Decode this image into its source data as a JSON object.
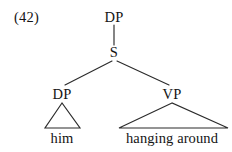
{
  "figure": {
    "example_number": "(42)",
    "type": "syntax-tree",
    "background_color": "#ffffff",
    "line_color": "#2b2b2b",
    "text_color": "#141414"
  },
  "tree": {
    "root": {
      "label": "DP",
      "x": 114,
      "y": 17
    },
    "nodes": [
      {
        "id": "s",
        "label": "S",
        "x": 114,
        "y": 52
      },
      {
        "id": "dp-subject",
        "label": "DP",
        "x": 62,
        "y": 94
      },
      {
        "id": "vp",
        "label": "VP",
        "x": 172,
        "y": 94
      }
    ],
    "terminals": [
      {
        "id": "him",
        "label": "him",
        "x": 62,
        "y": 138
      },
      {
        "id": "hanging-around",
        "label": "hanging around",
        "x": 172,
        "y": 138
      }
    ],
    "edges": [
      {
        "from": "DP",
        "to": "S",
        "x1": 114,
        "y1": 25,
        "x2": 114,
        "y2": 45
      },
      {
        "from": "S",
        "to": "DP",
        "x1": 112,
        "y1": 61,
        "x2": 65,
        "y2": 85
      },
      {
        "from": "S",
        "to": "VP",
        "x1": 117,
        "y1": 61,
        "x2": 169,
        "y2": 85
      }
    ],
    "triangles": [
      {
        "id": "dp-triangle",
        "apex_x": 62,
        "apex_y": 103,
        "left_x": 45,
        "right_x": 80,
        "base_y": 128
      },
      {
        "id": "vp-triangle",
        "apex_x": 172,
        "apex_y": 103,
        "left_x": 119,
        "right_x": 228,
        "base_y": 128
      }
    ]
  }
}
